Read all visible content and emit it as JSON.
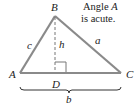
{
  "diagram": {
    "vertices": {
      "A": {
        "label": "A",
        "x": 20,
        "y": 73
      },
      "B": {
        "label": "B",
        "x": 55,
        "y": 16
      },
      "C": {
        "label": "C",
        "x": 121,
        "y": 73
      },
      "D": {
        "label": "D",
        "x": 55,
        "y": 73
      }
    },
    "sides": {
      "a": "a",
      "b": "b",
      "c": "c",
      "h": "h"
    },
    "note": {
      "line1_prefix": "Angle ",
      "line1_var": "A",
      "line2": "is acute."
    },
    "colors": {
      "triangle": "#8a8a8a",
      "text": "#222222",
      "brace": "#333333"
    }
  }
}
